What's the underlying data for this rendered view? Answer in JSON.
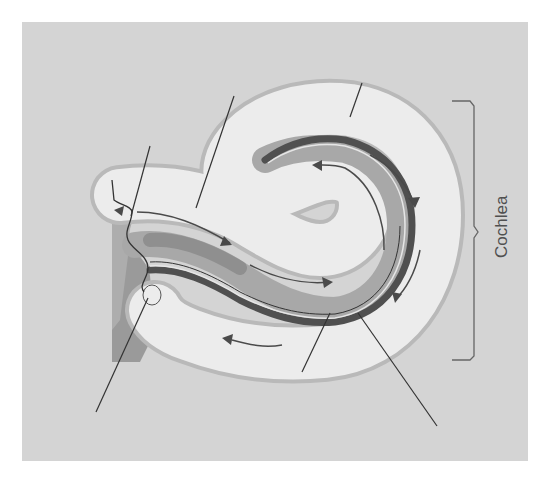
{
  "diagram": {
    "title": "Cochlea",
    "bracket_label": "Cochlea",
    "colors": {
      "background": "#d4d4d4",
      "outer_wall": "#b9b9b9",
      "fluid_canal": "#ececec",
      "cochlear_duct": "#a8a8a8",
      "basilar_membrane": "#505050",
      "arrows": "#4a4a4a",
      "leader_lines": "#333333",
      "label_text": "#505050"
    },
    "leader_lines": [
      {
        "id": "oval-window-pointer",
        "label": ""
      },
      {
        "id": "scala-vestibuli-pointer",
        "label": ""
      },
      {
        "id": "helicotrema-pointer",
        "label": ""
      },
      {
        "id": "round-window-pointer",
        "label": ""
      },
      {
        "id": "cochlear-duct-pointer",
        "label": ""
      },
      {
        "id": "basilar-membrane-pointer",
        "label": ""
      }
    ],
    "arrows_count": 7
  }
}
